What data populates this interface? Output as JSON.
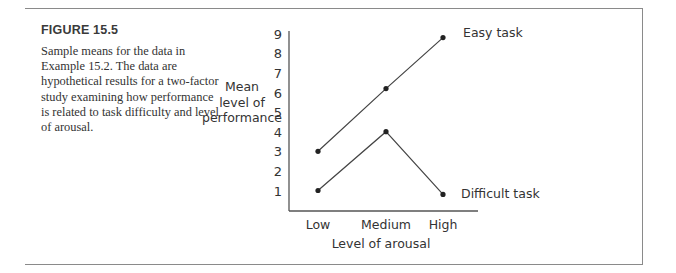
{
  "figure": {
    "label": "FIGURE 15.5",
    "caption": "Sample means for the data in Example 15.2. The data are hypothetical results for a two-factor study examining how performance is related to task difficulty and level of arousal."
  },
  "chart_data": {
    "type": "line",
    "title": "",
    "xlabel": "Level of arousal",
    "ylabel": "Mean level of performance",
    "ylabel_lines": [
      "Mean",
      "level of",
      "performance"
    ],
    "categories": [
      "Low",
      "Medium",
      "High"
    ],
    "yticks": [
      1,
      2,
      3,
      4,
      5,
      6,
      7,
      8,
      9
    ],
    "ylim": [
      0,
      9
    ],
    "grid": false,
    "legend_position": "inline-right",
    "series": [
      {
        "name": "Easy task",
        "values": [
          3,
          6.2,
          8.8
        ]
      },
      {
        "name": "Difficult task",
        "values": [
          1,
          4,
          0.8
        ]
      }
    ]
  }
}
